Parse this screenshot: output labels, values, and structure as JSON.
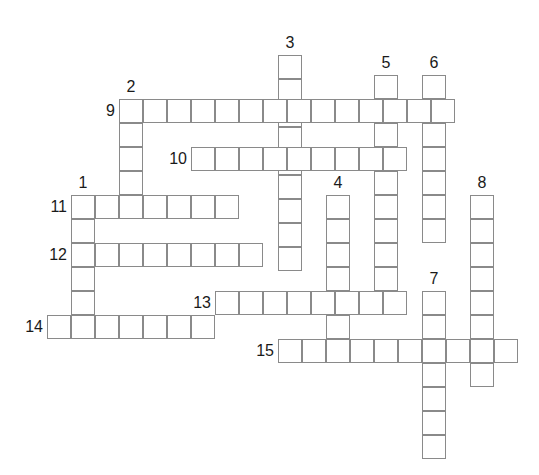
{
  "puzzle": {
    "type": "crossword-grid",
    "title": "",
    "cell_size": 24,
    "grid_origin": {
      "x": 48,
      "y": 55
    },
    "colors": {
      "cell_border": "#8a8a8a",
      "cell_fill": "#ffffff",
      "number_color": "#1a1a1a",
      "page_background": "#ffffff"
    },
    "entries": [
      {
        "number": "1",
        "direction": "down",
        "x": 71,
        "y": 195,
        "length": 5,
        "label_pos": "above"
      },
      {
        "number": "2",
        "direction": "down",
        "x": 119,
        "y": 99,
        "length": 5,
        "label_pos": "above"
      },
      {
        "number": "3",
        "direction": "down",
        "x": 278,
        "y": 55,
        "length": 9,
        "label_pos": "above"
      },
      {
        "number": "4",
        "direction": "down",
        "x": 326,
        "y": 195,
        "length": 7,
        "label_pos": "above"
      },
      {
        "number": "5",
        "direction": "down",
        "x": 374,
        "y": 75,
        "length": 10,
        "label_pos": "above"
      },
      {
        "number": "6",
        "direction": "down",
        "x": 422,
        "y": 75,
        "length": 7,
        "label_pos": "above"
      },
      {
        "number": "7",
        "direction": "down",
        "x": 422,
        "y": 291,
        "length": 7,
        "label_pos": "above"
      },
      {
        "number": "8",
        "direction": "down",
        "x": 470,
        "y": 195,
        "length": 8,
        "label_pos": "above"
      },
      {
        "number": "9",
        "direction": "across",
        "x": 119,
        "y": 99,
        "length": 14,
        "label_pos": "left"
      },
      {
        "number": "10",
        "direction": "across",
        "x": 191,
        "y": 147,
        "length": 9,
        "label_pos": "left"
      },
      {
        "number": "11",
        "direction": "across",
        "x": 71,
        "y": 195,
        "length": 7,
        "label_pos": "left"
      },
      {
        "number": "12",
        "direction": "across",
        "x": 71,
        "y": 243,
        "length": 8,
        "label_pos": "left"
      },
      {
        "number": "13",
        "direction": "across",
        "x": 215,
        "y": 291,
        "length": 8,
        "label_pos": "left"
      },
      {
        "number": "14",
        "direction": "across",
        "x": 47,
        "y": 315,
        "length": 7,
        "label_pos": "left"
      },
      {
        "number": "15",
        "direction": "across",
        "x": 278,
        "y": 339,
        "length": 10,
        "label_pos": "left"
      }
    ]
  }
}
